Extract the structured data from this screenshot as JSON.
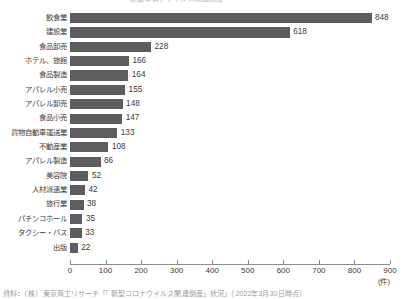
{
  "header": {
    "clipped_title": "新型コロナウイルス関連倒産"
  },
  "source": {
    "note": "資料：（株）東京商工リサーチ「「新型コロナウイルス関連倒産」状況」（2022年3月30日時点）"
  },
  "chart_data": {
    "type": "bar",
    "orientation": "horizontal",
    "title": "",
    "xlabel": "(件)",
    "ylabel": "",
    "xlim": [
      0,
      900
    ],
    "xticks": [
      0,
      100,
      200,
      300,
      400,
      500,
      600,
      700,
      800,
      900
    ],
    "grid": false,
    "legend": false,
    "bar_color": "#5d5d5d",
    "categories": [
      "飲食業",
      "建設業",
      "食品卸売",
      "ホテル、旅館",
      "食品製造",
      "アパレル小売",
      "アパレル卸売",
      "食品小売",
      "貨物自動車運送業",
      "不動産業",
      "アパレル製造",
      "美容院",
      "人材派遣業",
      "旅行業",
      "パチンコホール",
      "タクシー・バス",
      "出版"
    ],
    "values": [
      848,
      618,
      228,
      166,
      164,
      155,
      148,
      147,
      133,
      108,
      86,
      52,
      42,
      38,
      35,
      33,
      22
    ]
  }
}
